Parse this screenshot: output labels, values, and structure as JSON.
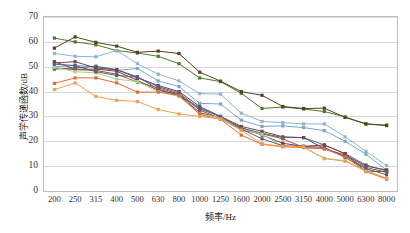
{
  "chart_data": {
    "type": "line",
    "title": "",
    "xlabel": "频率/Hz",
    "ylabel": "声学传递函数/dB",
    "categories": [
      "200",
      "250",
      "315",
      "400",
      "500",
      "630",
      "800",
      "1000",
      "1250",
      "1600",
      "2000",
      "2500",
      "3150",
      "4000",
      "5000",
      "6300",
      "8000"
    ],
    "ylim": [
      0,
      70
    ],
    "yticks": [
      "0",
      "10",
      "20",
      "30",
      "40",
      "50",
      "60",
      "70"
    ],
    "grid": true,
    "legend": "none",
    "markers": "square",
    "series": [
      {
        "name": "Series 1",
        "color": "#4a7a2a",
        "values": [
          61.5,
          60.0,
          58.8,
          56.5,
          55.5,
          54.2,
          51.2,
          45.5,
          44.0,
          39.3,
          33.2,
          33.8,
          33.0,
          32.0,
          29.8,
          27.0,
          26.5
        ]
      },
      {
        "name": "Series 2",
        "color": "#5a4020",
        "values": [
          57.5,
          62.0,
          59.8,
          58.3,
          55.8,
          56.3,
          55.3,
          47.8,
          44.2,
          40.0,
          38.5,
          34.0,
          33.2,
          33.3,
          29.6,
          27.0,
          26.3
        ]
      },
      {
        "name": "Series 3",
        "color": "#8fb4d0",
        "values": [
          55.3,
          54.2,
          54.0,
          56.5,
          51.2,
          47.0,
          44.3,
          39.2,
          39.0,
          31.3,
          28.0,
          27.5,
          27.0,
          27.0,
          21.8,
          16.0,
          10.2
        ]
      },
      {
        "name": "Series 4",
        "color": "#7ba7c4",
        "values": [
          50.0,
          50.5,
          50.0,
          48.5,
          49.3,
          44.3,
          42.0,
          35.3,
          35.0,
          28.5,
          26.0,
          26.2,
          25.5,
          24.3,
          20.0,
          14.8,
          8.4
        ]
      },
      {
        "name": "Series 5",
        "color": "#3f6f8f",
        "values": [
          49.0,
          49.5,
          50.2,
          48.8,
          46.0,
          41.0,
          38.5,
          33.5,
          29.8,
          25.3,
          23.3,
          21.5,
          21.5,
          18.5,
          15.0,
          10.5,
          8.0
        ]
      },
      {
        "name": "Series 6",
        "color": "#6b4a5a",
        "values": [
          51.5,
          52.0,
          49.5,
          48.8,
          45.5,
          42.5,
          40.0,
          34.0,
          30.0,
          26.0,
          24.0,
          21.8,
          21.5,
          17.0,
          14.5,
          10.0,
          8.5
        ]
      },
      {
        "name": "Series 7",
        "color": "#7a4030",
        "values": [
          52.0,
          49.0,
          49.0,
          48.2,
          44.5,
          40.5,
          38.8,
          31.5,
          29.5,
          25.5,
          22.5,
          19.2,
          18.0,
          18.5,
          15.0,
          8.0,
          7.8
        ]
      },
      {
        "name": "Series 8",
        "color": "#9c5b3a",
        "values": [
          49.5,
          48.8,
          48.5,
          47.0,
          43.8,
          41.5,
          39.0,
          32.5,
          29.2,
          24.5,
          23.0,
          21.0,
          17.5,
          17.0,
          14.0,
          9.5,
          7.5
        ]
      },
      {
        "name": "Series 9",
        "color": "#a8d08d",
        "values": [
          49.8,
          48.0,
          47.5,
          45.0,
          44.0,
          40.0,
          38.0,
          31.0,
          29.5,
          25.0,
          22.8,
          18.0,
          17.5,
          13.2,
          12.2,
          8.5,
          5.0
        ]
      },
      {
        "name": "Series 10",
        "color": "#5b5b8a",
        "values": [
          51.0,
          50.5,
          48.0,
          46.5,
          45.8,
          42.0,
          39.5,
          33.0,
          30.0,
          25.0,
          21.0,
          18.2,
          18.0,
          17.5,
          13.5,
          9.0,
          6.5
        ]
      },
      {
        "name": "Series 11",
        "color": "#e06a3a",
        "values": [
          43.3,
          45.5,
          45.5,
          43.5,
          39.8,
          39.8,
          38.5,
          30.8,
          28.8,
          22.5,
          18.8,
          17.8,
          17.5,
          17.0,
          13.8,
          7.8,
          4.8
        ]
      },
      {
        "name": "Series 12",
        "color": "#f0a050",
        "values": [
          40.8,
          43.5,
          38.0,
          36.5,
          36.0,
          32.8,
          31.0,
          30.0,
          29.0,
          24.5,
          19.0,
          18.0,
          17.8,
          13.0,
          12.0,
          8.0,
          5.2
        ]
      }
    ]
  }
}
